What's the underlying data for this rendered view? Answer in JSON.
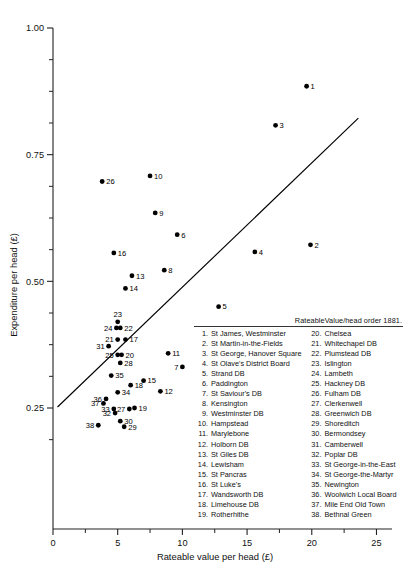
{
  "chart_data": {
    "type": "scatter",
    "title": "",
    "xlabel": "Rateable value per head (£)",
    "ylabel": "Expenditure per head (£)",
    "xlim": [
      0,
      26.2
    ],
    "ylim": [
      0.175,
      1.0
    ],
    "xticks": [
      0,
      5,
      10,
      15,
      20,
      25
    ],
    "xticklabels": [
      "0",
      "5",
      "10",
      "15",
      "20",
      "25"
    ],
    "yticks": [
      0.25,
      0.5,
      0.75,
      1.0
    ],
    "yticklabels": [
      "0.25",
      "0.50",
      "0.75",
      "1.00"
    ],
    "minor_yticks": [
      0.3125,
      0.375,
      0.4375,
      0.5625,
      0.625,
      0.6875,
      0.8125,
      0.875,
      0.9375,
      0.1875,
      0.21875
    ],
    "grid": false,
    "legend_position": "inside-lower-right",
    "trendline": {
      "x0": 0.35,
      "y0": 0.252,
      "x1": 23.6,
      "y1": 0.822
    },
    "points": [
      {
        "id": 1,
        "label": "St James, Westminster",
        "x": 19.6,
        "y": 0.885,
        "label_side": "right"
      },
      {
        "id": 2,
        "label": "St Martin-in-the-Fields",
        "x": 19.9,
        "y": 0.572,
        "label_side": "right"
      },
      {
        "id": 3,
        "label": "St George, Hanover Square",
        "x": 17.2,
        "y": 0.808,
        "label_side": "right"
      },
      {
        "id": 4,
        "label": "St Olave's District Board",
        "x": 15.6,
        "y": 0.558,
        "label_side": "right"
      },
      {
        "id": 5,
        "label": "Strand DB",
        "x": 12.8,
        "y": 0.45,
        "label_side": "right"
      },
      {
        "id": 6,
        "label": "Paddington",
        "x": 9.6,
        "y": 0.592,
        "label_side": "right"
      },
      {
        "id": 7,
        "label": "St Saviour's DB",
        "x": 10.0,
        "y": 0.331,
        "label_side": "left"
      },
      {
        "id": 8,
        "label": "Kensington",
        "x": 8.6,
        "y": 0.522,
        "label_side": "right"
      },
      {
        "id": 9,
        "label": "Westminster DB",
        "x": 7.9,
        "y": 0.635,
        "label_side": "right"
      },
      {
        "id": 10,
        "label": "Hampstead",
        "x": 7.5,
        "y": 0.708,
        "label_side": "right"
      },
      {
        "id": 11,
        "label": "Marylebone",
        "x": 8.9,
        "y": 0.358,
        "label_side": "right"
      },
      {
        "id": 12,
        "label": "Holborn DB",
        "x": 8.3,
        "y": 0.283,
        "label_side": "right"
      },
      {
        "id": 13,
        "label": "St Giles DB",
        "x": 6.1,
        "y": 0.511,
        "label_side": "right"
      },
      {
        "id": 14,
        "label": "Lewisham",
        "x": 5.6,
        "y": 0.486,
        "label_side": "right"
      },
      {
        "id": 15,
        "label": "St Pancras",
        "x": 7.0,
        "y": 0.304,
        "label_side": "right"
      },
      {
        "id": 16,
        "label": "St Luke's",
        "x": 4.7,
        "y": 0.556,
        "label_side": "right"
      },
      {
        "id": 17,
        "label": "Wandsworth DB",
        "x": 5.6,
        "y": 0.385,
        "label_side": "right"
      },
      {
        "id": 18,
        "label": "Limehouse DB",
        "x": 6.0,
        "y": 0.295,
        "label_side": "right"
      },
      {
        "id": 19,
        "label": "Rotherhithe",
        "x": 6.3,
        "y": 0.25,
        "label_side": "right"
      },
      {
        "id": 20,
        "label": "Chelsea",
        "x": 5.3,
        "y": 0.355,
        "label_side": "right"
      },
      {
        "id": 21,
        "label": "Whitechapel DB",
        "x": 5.0,
        "y": 0.385,
        "label_side": "left"
      },
      {
        "id": 22,
        "label": "Plumstead DB",
        "x": 5.2,
        "y": 0.408,
        "label_side": "right"
      },
      {
        "id": 23,
        "label": "Islington",
        "x": 5.0,
        "y": 0.42,
        "label_side": "top"
      },
      {
        "id": 24,
        "label": "Lambeth",
        "x": 4.9,
        "y": 0.408,
        "label_side": "left"
      },
      {
        "id": 25,
        "label": "Hackney DB",
        "x": 5.0,
        "y": 0.355,
        "label_side": "left"
      },
      {
        "id": 26,
        "label": "Fulham DB",
        "x": 3.8,
        "y": 0.697,
        "label_side": "right"
      },
      {
        "id": 27,
        "label": "Clerkenwell",
        "x": 5.9,
        "y": 0.248,
        "label_side": "left"
      },
      {
        "id": 28,
        "label": "Greenwich DB",
        "x": 5.2,
        "y": 0.339,
        "label_side": "right"
      },
      {
        "id": 29,
        "label": "Shoreditch",
        "x": 5.5,
        "y": 0.213,
        "label_side": "right"
      },
      {
        "id": 30,
        "label": "Bermondsey",
        "x": 5.2,
        "y": 0.224,
        "label_side": "right"
      },
      {
        "id": 31,
        "label": "Camberwell",
        "x": 4.3,
        "y": 0.372,
        "label_side": "left"
      },
      {
        "id": 32,
        "label": "Poplar DB",
        "x": 4.8,
        "y": 0.24,
        "label_side": "left"
      },
      {
        "id": 33,
        "label": "St George-in-the-East",
        "x": 4.7,
        "y": 0.248,
        "label_side": "left"
      },
      {
        "id": 34,
        "label": "St George-the-Martyr",
        "x": 5.0,
        "y": 0.281,
        "label_side": "right"
      },
      {
        "id": 35,
        "label": "Newington",
        "x": 4.5,
        "y": 0.314,
        "label_side": "right"
      },
      {
        "id": 36,
        "label": "Woolwich Local Board",
        "x": 4.1,
        "y": 0.268,
        "label_side": "left"
      },
      {
        "id": 37,
        "label": "Mile End Old Town",
        "x": 3.9,
        "y": 0.259,
        "label_side": "left"
      },
      {
        "id": 38,
        "label": "Bethnal Green",
        "x": 3.5,
        "y": 0.216,
        "label_side": "left"
      }
    ]
  },
  "legend": {
    "header": "RateableValue/head order 1881.",
    "column1": [
      {
        "num": "1.",
        "name": "St James, Westminster"
      },
      {
        "num": "2.",
        "name": "St Martin-in-the-Fields"
      },
      {
        "num": "3.",
        "name": "St George, Hanover Square"
      },
      {
        "num": "4.",
        "name": "St Olave's District Board"
      },
      {
        "num": "5.",
        "name": "Strand DB"
      },
      {
        "num": "6.",
        "name": "Paddington"
      },
      {
        "num": "7.",
        "name": "St Saviour's DB"
      },
      {
        "num": "8.",
        "name": "Kensington"
      },
      {
        "num": "9.",
        "name": "Westminster DB"
      },
      {
        "num": "10.",
        "name": "Hampstead"
      },
      {
        "num": "11.",
        "name": "Marylebone"
      },
      {
        "num": "12.",
        "name": "Holborn DB"
      },
      {
        "num": "13.",
        "name": "St Giles DB"
      },
      {
        "num": "14.",
        "name": "Lewisham"
      },
      {
        "num": "15.",
        "name": "St Pancras"
      },
      {
        "num": "16.",
        "name": "St Luke's"
      },
      {
        "num": "17.",
        "name": "Wandsworth DB"
      },
      {
        "num": "18.",
        "name": "Limehouse DB"
      },
      {
        "num": "19.",
        "name": "Rotherhithe"
      }
    ],
    "column2": [
      {
        "num": "20.",
        "name": "Chelsea"
      },
      {
        "num": "21.",
        "name": "Whitechapel DB"
      },
      {
        "num": "22.",
        "name": "Plumstead DB"
      },
      {
        "num": "23.",
        "name": "Islington"
      },
      {
        "num": "24.",
        "name": "Lambeth"
      },
      {
        "num": "25.",
        "name": "Hackney DB"
      },
      {
        "num": "26.",
        "name": "Fulham DB"
      },
      {
        "num": "27.",
        "name": "Clerkenwell"
      },
      {
        "num": "28.",
        "name": "Greenwich DB"
      },
      {
        "num": "29.",
        "name": "Shoreditch"
      },
      {
        "num": "30.",
        "name": "Bermondsey"
      },
      {
        "num": "31.",
        "name": "Camberwell"
      },
      {
        "num": "32.",
        "name": "Poplar DB"
      },
      {
        "num": "33.",
        "name": "St George-in-the-East"
      },
      {
        "num": "34.",
        "name": "St George-the-Martyr"
      },
      {
        "num": "35.",
        "name": "Newington"
      },
      {
        "num": "36.",
        "name": "Woolwich Local Board"
      },
      {
        "num": "37.",
        "name": "Mile End Old Town"
      },
      {
        "num": "38.",
        "name": "Bethnal Green"
      }
    ]
  },
  "colors": {
    "point": "#000000",
    "axis": "#222222",
    "background": "#ffffff"
  }
}
